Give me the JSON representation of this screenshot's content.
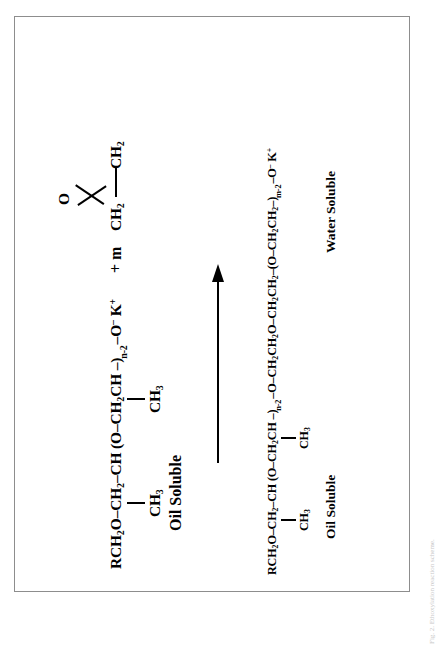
{
  "figure": {
    "background_color": "#ffffff",
    "border_color": "#8d8d8d",
    "caption": "Fig. 2. Ethoxylation reaction scheme."
  },
  "scheme": {
    "reactant": {
      "formula_html": "RCH<sub>2</sub>O&#8211;CH<sub>2</sub>&#8211;CH &#40;O&#8211;CH<sub>2</sub>CH &#8211;&#41;<span class=\"rep-sub\">n-2</span>&#8211;O<sup>&#8211;</sup> K<sup>+</sup>",
      "formula_plain": "RCH2O-CH2-CH(O-CH2CH-)n-2-O- K+",
      "pendant_1": "CH3",
      "pendant_1_html": "CH<sub>3</sub>",
      "pendant_2": "CH3",
      "pendant_2_html": "CH<sub>3</sub>",
      "repeat_subscript": "n-2",
      "charge_anion": "–",
      "counter_ion": "K+",
      "solubility_label": "Oil Soluble"
    },
    "coreactant": {
      "plus_label": "+ m",
      "name": "ethylene oxide",
      "oxygen_label": "O",
      "carbon_left": "CH2",
      "carbon_left_html": "CH<sub>2</sub>",
      "carbon_right": "CH2",
      "carbon_right_html": "CH<sub>2</sub>",
      "stoichiometry": "m"
    },
    "arrow": {
      "direction": "right",
      "label": ""
    },
    "product": {
      "formula_html": "RCH<sub>2</sub>O&#8211;CH<sub>2</sub>&#8211;CH &#40;O&#8211;CH<sub>2</sub>CH &#8211;&#41;<span class=\"rep-sub\">n-2</span>&#8211;O&#8211;CH<sub>2</sub>CH<sub>2</sub>O&#8211;CH<sub>2</sub>CH<sub>2</sub>&#8211;&#40;O&#8211;CH<sub>2</sub>CH<sub>2</sub>&#8211;&#41;<span class=\"rep-sub\">m-2</span>&#8211;O<sup>&#8211;</sup> K<sup>+</sup>",
      "formula_plain": "RCH2O-CH2-CH(O-CH2CH-)n-2-O-CH2CH2O-CH2CH2-(O-CH2CH2-)m-2-O- K+",
      "pendant_1": "CH3",
      "pendant_1_html": "CH<sub>3</sub>",
      "pendant_2": "CH3",
      "pendant_2_html": "CH<sub>3</sub>",
      "repeat_subscript_propylene": "n-2",
      "repeat_subscript_ethylene": "m-2",
      "charge_anion": "–",
      "counter_ion": "K+",
      "solubility_label_left": "Oil Soluble",
      "solubility_label_right": "Water Soluble"
    }
  },
  "chart_data": {
    "type": "diagram",
    "nodes": [
      {
        "id": "reactant-polymer",
        "role": "reactant",
        "text": "RCH2O-CH2-CH(CH3)-(O-CH2CH(CH3)-)n-2-O- K+",
        "annotation": "Oil Soluble"
      },
      {
        "id": "ethylene-oxide",
        "role": "reactant",
        "text": "+ m (ethylene oxide epoxide: O / CH2-CH2)",
        "annotation": ""
      },
      {
        "id": "product-polymer",
        "role": "product",
        "text": "RCH2O-CH2-CH(CH3)-(O-CH2CH(CH3)-)n-2-O-CH2CH2O-CH2CH2-(O-CH2CH2-)m-2-O- K+",
        "annotation": "Oil Soluble (left block) / Water Soluble (right block)"
      }
    ],
    "edges": [
      {
        "from": "reactant-polymer",
        "to": "product-polymer",
        "label": "",
        "style": "solid-arrow"
      }
    ]
  }
}
